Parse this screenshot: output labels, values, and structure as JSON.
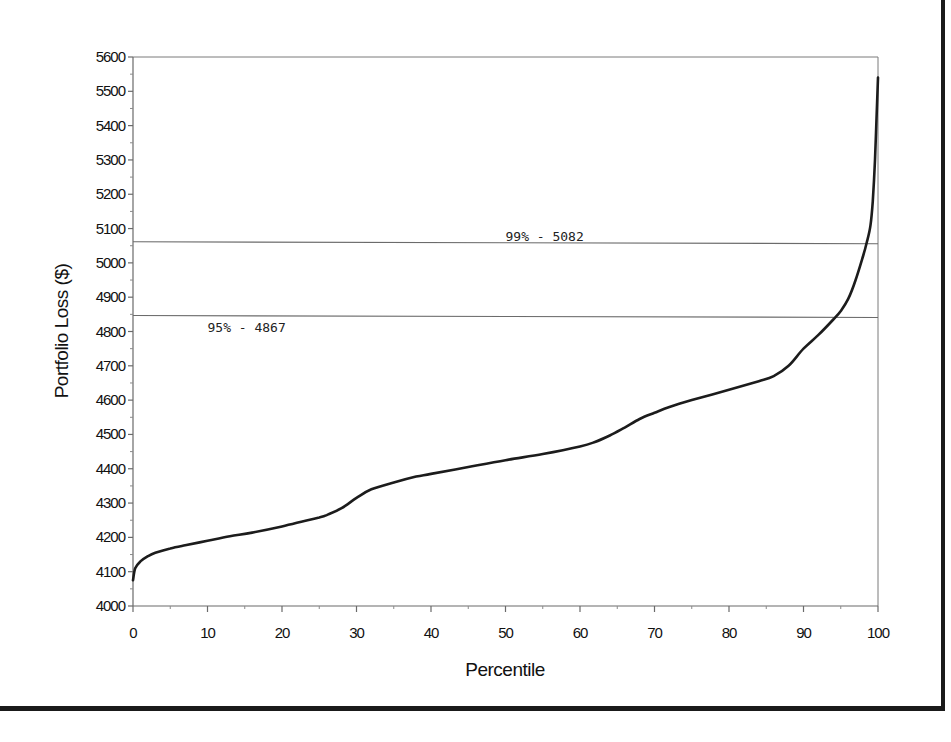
{
  "chart_data": {
    "type": "line",
    "title": "",
    "xlabel": "Percentile",
    "ylabel": "Portfolio Loss ($)",
    "xlim": [
      0,
      100
    ],
    "ylim": [
      4000,
      5600
    ],
    "x_ticks": [
      0,
      10,
      20,
      30,
      40,
      50,
      60,
      70,
      80,
      90,
      100
    ],
    "y_ticks": [
      4000,
      4100,
      4200,
      4300,
      4400,
      4500,
      4600,
      4700,
      4800,
      4900,
      5000,
      5100,
      5200,
      5300,
      5400,
      5500,
      5600
    ],
    "grid": false,
    "legend": null,
    "series": [
      {
        "name": "Portfolio Loss",
        "x": [
          0,
          0.3,
          1,
          2,
          3,
          5,
          7,
          10,
          13,
          16,
          20,
          23,
          25,
          26,
          28,
          30,
          32,
          35,
          38,
          40,
          45,
          50,
          55,
          60,
          62,
          64,
          66,
          68,
          70,
          72,
          75,
          80,
          84,
          86,
          88,
          90,
          92,
          94,
          95,
          96,
          97,
          98,
          98.5,
          99,
          99.3,
          99.6,
          99.8,
          100
        ],
        "values": [
          4075,
          4110,
          4130,
          4145,
          4155,
          4168,
          4177,
          4190,
          4203,
          4214,
          4232,
          4248,
          4258,
          4265,
          4285,
          4315,
          4340,
          4360,
          4377,
          4385,
          4405,
          4425,
          4443,
          4465,
          4478,
          4497,
          4520,
          4545,
          4563,
          4580,
          4600,
          4630,
          4655,
          4670,
          4700,
          4750,
          4790,
          4835,
          4860,
          4895,
          4950,
          5020,
          5060,
          5110,
          5180,
          5300,
          5420,
          5540
        ]
      }
    ],
    "annotations": [
      {
        "text": "99% - 5082",
        "type": "hline",
        "y": 5082,
        "label_x": 50
      },
      {
        "text": "95% - 4867",
        "type": "hline",
        "y": 4867,
        "label_x": 10
      }
    ]
  },
  "labels": {
    "xlabel": "Percentile",
    "ylabel": "Portfolio Loss ($)",
    "ref99": "99% - 5082",
    "ref95": "95% - 4867"
  }
}
